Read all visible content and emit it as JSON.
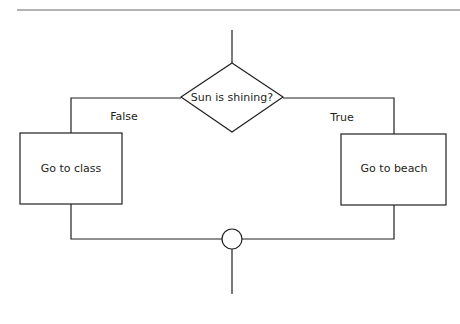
{
  "diagram": {
    "decision": {
      "label": "Sun is shining?"
    },
    "branches": {
      "false": {
        "label": "False"
      },
      "true": {
        "label": "True"
      }
    },
    "processes": {
      "left": {
        "label": "Go to class"
      },
      "right": {
        "label": "Go to beach"
      }
    },
    "colors": {
      "stroke": "#231f20",
      "rule": "#9a9a9a"
    }
  }
}
